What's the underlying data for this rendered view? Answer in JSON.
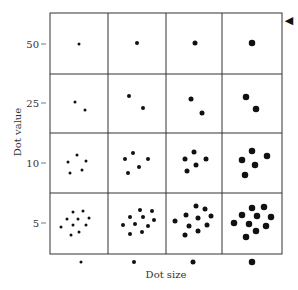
{
  "chart_data": {
    "type": "scatter",
    "title": "",
    "xlabel": "Dot size",
    "ylabel": "Dot value",
    "row_labels": [
      "50",
      "25",
      "10",
      "5"
    ],
    "col_labels_dot_sizes": [
      3,
      4,
      5,
      6.5
    ],
    "grid": true,
    "dot_counts": {
      "50": 1,
      "25": 2,
      "10": 5,
      "5": 10
    },
    "cells": [
      {
        "row": "50",
        "col": 1,
        "dots": [
          [
            79,
            44
          ]
        ]
      },
      {
        "row": "50",
        "col": 2,
        "dots": [
          [
            137,
            43
          ]
        ]
      },
      {
        "row": "50",
        "col": 3,
        "dots": [
          [
            195,
            43
          ]
        ]
      },
      {
        "row": "50",
        "col": 4,
        "dots": [
          [
            252,
            43
          ]
        ]
      },
      {
        "row": "25",
        "col": 1,
        "dots": [
          [
            75,
            102
          ],
          [
            85,
            110
          ]
        ]
      },
      {
        "row": "25",
        "col": 2,
        "dots": [
          [
            129,
            96
          ],
          [
            143,
            108
          ]
        ]
      },
      {
        "row": "25",
        "col": 3,
        "dots": [
          [
            191,
            99
          ],
          [
            202,
            113
          ]
        ]
      },
      {
        "row": "25",
        "col": 4,
        "dots": [
          [
            246,
            97
          ],
          [
            256,
            109
          ]
        ]
      },
      {
        "row": "10",
        "col": 1,
        "dots": [
          [
            77,
            155
          ],
          [
            68,
            162
          ],
          [
            86,
            161
          ],
          [
            70,
            173
          ],
          [
            82,
            170
          ]
        ]
      },
      {
        "row": "10",
        "col": 2,
        "dots": [
          [
            133,
            153
          ],
          [
            125,
            159
          ],
          [
            148,
            159
          ],
          [
            139,
            167
          ],
          [
            128,
            173
          ]
        ]
      },
      {
        "row": "10",
        "col": 3,
        "dots": [
          [
            194,
            152
          ],
          [
            185,
            159
          ],
          [
            206,
            159
          ],
          [
            196,
            165
          ],
          [
            187,
            171
          ]
        ]
      },
      {
        "row": "10",
        "col": 4,
        "dots": [
          [
            252,
            151
          ],
          [
            242,
            160
          ],
          [
            267,
            156
          ],
          [
            255,
            165
          ],
          [
            245,
            175
          ]
        ]
      },
      {
        "row": "5",
        "col": 1,
        "dots": [
          [
            73,
            212
          ],
          [
            83,
            211
          ],
          [
            67,
            219
          ],
          [
            78,
            219
          ],
          [
            89,
            218
          ],
          [
            61,
            227
          ],
          [
            73,
            225
          ],
          [
            86,
            225
          ],
          [
            71,
            235
          ],
          [
            79,
            232
          ]
        ]
      },
      {
        "row": "5",
        "col": 2,
        "dots": [
          [
            140,
            210
          ],
          [
            152,
            211
          ],
          [
            130,
            217
          ],
          [
            143,
            217
          ],
          [
            154,
            220
          ],
          [
            123,
            225
          ],
          [
            135,
            224
          ],
          [
            148,
            226
          ],
          [
            130,
            234
          ],
          [
            142,
            232
          ]
        ]
      },
      {
        "row": "5",
        "col": 3,
        "dots": [
          [
            196,
            206
          ],
          [
            205,
            209
          ],
          [
            186,
            215
          ],
          [
            198,
            218
          ],
          [
            211,
            216
          ],
          [
            175,
            221
          ],
          [
            189,
            226
          ],
          [
            207,
            225
          ],
          [
            185,
            235
          ],
          [
            198,
            231
          ]
        ]
      },
      {
        "row": "5",
        "col": 4,
        "dots": [
          [
            252,
            208
          ],
          [
            264,
            207
          ],
          [
            242,
            215
          ],
          [
            257,
            216
          ],
          [
            271,
            217
          ],
          [
            234,
            223
          ],
          [
            249,
            224
          ],
          [
            266,
            226
          ],
          [
            246,
            237
          ],
          [
            256,
            231
          ]
        ]
      }
    ],
    "legend_dots": [
      [
        81,
        262
      ],
      [
        134,
        262
      ],
      [
        193,
        262
      ],
      [
        252,
        262
      ]
    ]
  },
  "axes": {
    "y_title": "Dot value",
    "x_title": "Dot size",
    "y_ticks": [
      "50",
      "25",
      "10",
      "5"
    ]
  },
  "marker": {
    "name": "pointer-arrow",
    "glyph": "◀"
  }
}
